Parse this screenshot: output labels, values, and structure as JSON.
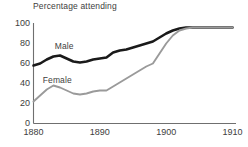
{
  "chart_data": {
    "type": "line",
    "title": "Percentage attending",
    "xlabel": "",
    "ylabel": "",
    "xlim": [
      1880,
      1910
    ],
    "ylim": [
      0,
      100
    ],
    "grid": false,
    "legend_position": "inline-labels",
    "x_ticks": [
      "1880",
      "1890",
      "1900",
      "1910"
    ],
    "x_tick_values": [
      1880,
      1890,
      1900,
      1910
    ],
    "y_ticks": [
      "0",
      "20",
      "40",
      "60",
      "80",
      "100"
    ],
    "y_tick_values": [
      0,
      20,
      40,
      60,
      80,
      100
    ],
    "x": [
      1880,
      1881,
      1882,
      1883,
      1884,
      1885,
      1886,
      1887,
      1888,
      1889,
      1890,
      1891,
      1892,
      1893,
      1894,
      1895,
      1896,
      1897,
      1898,
      1899,
      1900,
      1901,
      1902,
      1903,
      1904,
      1905,
      1906,
      1907,
      1908,
      1909,
      1910
    ],
    "series": [
      {
        "name": "Male",
        "color": "#1a1a1a",
        "width": 2.6,
        "label_x": 1883.2,
        "label_y": 78,
        "values": [
          58,
          60,
          64,
          67,
          68,
          65,
          62,
          61,
          62,
          64,
          65,
          66,
          71,
          73,
          74,
          76,
          78,
          80,
          82,
          86,
          90,
          93,
          95,
          96,
          96,
          96,
          96,
          96,
          96,
          96,
          96
        ]
      },
      {
        "name": "Female",
        "color": "#9a9a9a",
        "width": 1.9,
        "label_x": 1881.4,
        "label_y": 44,
        "values": [
          22,
          28,
          34,
          38,
          36,
          33,
          30,
          29,
          30,
          32,
          33,
          33,
          37,
          41,
          45,
          49,
          53,
          57,
          60,
          70,
          80,
          88,
          93,
          95,
          96,
          96,
          96,
          96,
          96,
          96,
          96
        ]
      }
    ],
    "axis_color": "#6f6f6f"
  }
}
